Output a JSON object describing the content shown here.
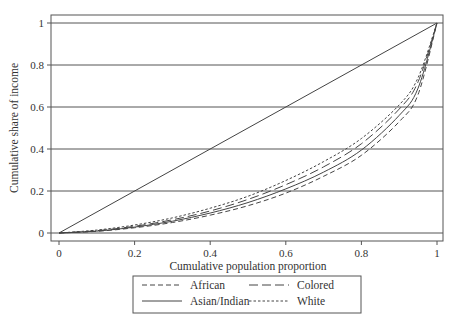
{
  "chart_data": {
    "type": "line",
    "title": "",
    "xlabel": "Cumulative population proportion",
    "ylabel": "Cumulative share of income",
    "xlim": [
      0,
      1
    ],
    "ylim": [
      0,
      1
    ],
    "xticks": [
      0,
      0.2,
      0.4,
      0.6,
      0.8,
      1
    ],
    "xtick_labels": [
      "0",
      "0.2",
      "0.4",
      "0.6",
      "0.8",
      "1"
    ],
    "yticks": [
      0,
      0.2,
      0.4,
      0.6,
      0.8,
      1
    ],
    "ytick_labels": [
      "0",
      "0.2",
      "0.4",
      "0.6",
      "0.8",
      "1"
    ],
    "grid": "horizontal",
    "legend_position": "bottom",
    "equality_line": {
      "x": [
        0,
        1
      ],
      "y": [
        0,
        1
      ]
    },
    "x": [
      0,
      0.1,
      0.2,
      0.3,
      0.4,
      0.5,
      0.6,
      0.7,
      0.8,
      0.9,
      0.95,
      1
    ],
    "series": [
      {
        "name": "African",
        "style": "dashed",
        "values": [
          0,
          0.008,
          0.025,
          0.05,
          0.085,
          0.13,
          0.19,
          0.27,
          0.37,
          0.53,
          0.66,
          1
        ]
      },
      {
        "name": "Colored",
        "style": "longdash",
        "values": [
          0,
          0.011,
          0.032,
          0.063,
          0.105,
          0.16,
          0.23,
          0.315,
          0.425,
          0.59,
          0.72,
          1
        ]
      },
      {
        "name": "Asian/Indian",
        "style": "solid",
        "values": [
          0,
          0.009,
          0.028,
          0.056,
          0.095,
          0.145,
          0.21,
          0.29,
          0.395,
          0.56,
          0.69,
          1
        ]
      },
      {
        "name": "White",
        "style": "shortdash",
        "values": [
          0,
          0.014,
          0.038,
          0.072,
          0.118,
          0.175,
          0.25,
          0.34,
          0.45,
          0.61,
          0.74,
          1
        ]
      }
    ],
    "legend": [
      {
        "name": "African",
        "style": "dashed"
      },
      {
        "name": "Colored",
        "style": "longdash"
      },
      {
        "name": "Asian/Indian",
        "style": "solid"
      },
      {
        "name": "White",
        "style": "shortdash"
      }
    ]
  }
}
